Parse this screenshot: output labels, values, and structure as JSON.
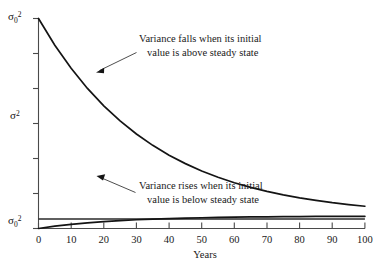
{
  "chart_data": {
    "type": "line",
    "title": "",
    "xlabel": "Years",
    "ylabel": "",
    "xlim": [
      0,
      100
    ],
    "ylim": [
      0,
      1
    ],
    "grid": false,
    "legend": "none",
    "xticks": [
      0,
      10,
      20,
      30,
      40,
      50,
      60,
      70,
      80,
      90,
      100
    ],
    "xticklabels": [
      "0",
      "10",
      "20",
      "30",
      "40",
      "50",
      "60",
      "70",
      "80",
      "90",
      "100"
    ],
    "ytick_count": 7,
    "yticklabels_shown": [
      "sigma_0^2 (top)",
      "sigma^2 (middle)",
      "sigma_0^2 (bottom)"
    ],
    "y_axis_labels": {
      "top": {
        "symbol": "σ",
        "sub": "0",
        "sup": "2",
        "value_meaning": "initial variance above steady state"
      },
      "middle": {
        "symbol": "σ",
        "sub": "",
        "sup": "2",
        "value_meaning": "steady-state variance"
      },
      "bottom": {
        "symbol": "σ",
        "sub": "0",
        "sup": "2",
        "value_meaning": "initial variance below steady state"
      }
    },
    "series": [
      {
        "name": "Variance falling from high initial value",
        "description": "Exponential decay toward steady state",
        "x": [
          0,
          5,
          10,
          15,
          20,
          25,
          30,
          35,
          40,
          45,
          50,
          55,
          60,
          65,
          70,
          75,
          80,
          85,
          90,
          95,
          100
        ],
        "y": [
          1.0,
          0.873,
          0.763,
          0.667,
          0.584,
          0.512,
          0.45,
          0.396,
          0.349,
          0.309,
          0.274,
          0.244,
          0.218,
          0.196,
          0.177,
          0.16,
          0.146,
          0.134,
          0.123,
          0.114,
          0.106
        ]
      },
      {
        "name": "Steady-state variance",
        "description": "Horizontal line at the steady-state level",
        "x": [
          0,
          100
        ],
        "y": [
          0.0455,
          0.0455
        ]
      },
      {
        "name": "Variance rising from low initial value",
        "description": "Exponential rise toward steady state",
        "x": [
          0,
          5,
          10,
          15,
          20,
          25,
          30,
          35,
          40,
          45,
          50,
          55,
          60,
          65,
          70,
          75,
          80,
          85,
          90,
          95,
          100
        ],
        "y": [
          0.0,
          0.0111,
          0.0199,
          0.0271,
          0.033,
          0.0377,
          0.0416,
          0.0448,
          0.0474,
          0.0495,
          0.0512,
          0.0527,
          0.0539,
          0.0549,
          0.0557,
          0.0563,
          0.0569,
          0.0573,
          0.0577,
          0.058,
          0.0582
        ]
      }
    ],
    "annotations": [
      {
        "name": "upper-annotation",
        "lines": [
          "Variance falls when its initial",
          "value is above steady state"
        ],
        "points_to": {
          "x": 17,
          "y": 0.63
        }
      },
      {
        "name": "lower-annotation",
        "lines": [
          "Variance rises when its initial",
          "value is below steady state"
        ],
        "points_to": {
          "x": 17,
          "y": 0.028
        }
      }
    ]
  }
}
